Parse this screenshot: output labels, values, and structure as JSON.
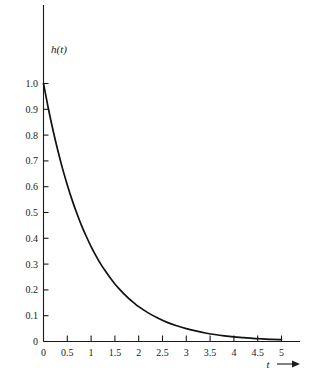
{
  "chart_data": {
    "type": "line",
    "title": "",
    "subtitle": "",
    "xlabel": "t",
    "ylabel": "h(t)",
    "xlim": [
      0,
      5.25
    ],
    "ylim": [
      0,
      1.05
    ],
    "grid": false,
    "legend": null,
    "x_ticks": [
      0,
      0.5,
      1,
      1.5,
      2,
      2.5,
      3,
      3.5,
      4,
      4.5,
      5
    ],
    "x_tick_labels": [
      "0",
      "0.5",
      "1",
      "1.5",
      "2",
      "2.5",
      "3",
      "3.5",
      "4",
      "4.5",
      "5"
    ],
    "y_ticks": [
      0,
      0.1,
      0.2,
      0.3,
      0.4,
      0.5,
      0.6,
      0.7,
      0.8,
      0.9,
      1.0
    ],
    "y_tick_labels": [
      "0",
      "0.1",
      "0.2",
      "0.3",
      "0.4",
      "0.5",
      "0.6",
      "0.7",
      "0.8",
      "0.9",
      "1.0"
    ],
    "x_axis_arrow": true,
    "series": [
      {
        "name": "h(t)",
        "color": "#111111",
        "x": [
          0,
          0.1,
          0.2,
          0.3,
          0.4,
          0.5,
          0.6,
          0.7,
          0.8,
          0.9,
          1.0,
          1.1,
          1.2,
          1.3,
          1.4,
          1.5,
          1.6,
          1.7,
          1.8,
          1.9,
          2.0,
          2.2,
          2.4,
          2.6,
          2.8,
          3.0,
          3.2,
          3.4,
          3.6,
          3.8,
          4.0,
          4.2,
          4.4,
          4.6,
          4.8,
          5.0
        ],
        "values": [
          1.0,
          0.905,
          0.819,
          0.741,
          0.67,
          0.607,
          0.549,
          0.497,
          0.449,
          0.407,
          0.368,
          0.333,
          0.301,
          0.273,
          0.247,
          0.223,
          0.202,
          0.183,
          0.165,
          0.15,
          0.135,
          0.111,
          0.091,
          0.074,
          0.061,
          0.05,
          0.041,
          0.033,
          0.027,
          0.022,
          0.018,
          0.015,
          0.012,
          0.01,
          0.008,
          0.007
        ]
      }
    ]
  },
  "labels": {
    "y_axis_label": "h(t)",
    "x_axis_label": "t"
  },
  "colors": {
    "curve": "#111111",
    "axis": "#1a1a1a",
    "background": "#ffffff"
  }
}
